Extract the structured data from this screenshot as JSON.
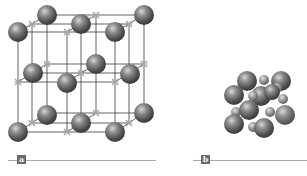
{
  "figure": {
    "panels": [
      {
        "id": "a",
        "label": "a",
        "description": "Expanded crystal lattice: large spheres at lattice sites connected by lines, small x-shaped markers for smaller ions",
        "sphere_color": "#6e6e6e",
        "marker_color": "#a6a6a6"
      },
      {
        "id": "b",
        "label": "b",
        "description": "Space-filling model of the same unit cell with large and small spheres packed together",
        "sphere_color": "#6e6e6e"
      }
    ]
  },
  "colors": {
    "background": "#ffffff",
    "line": "#3a3a3a",
    "rule": "#a8a8a8",
    "label_box": "#6b6b6b"
  }
}
